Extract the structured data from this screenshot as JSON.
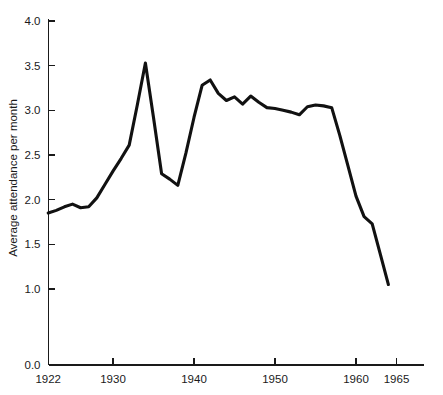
{
  "chart_data": {
    "type": "line",
    "title": "",
    "xlabel": "",
    "ylabel": "Average attendance per month",
    "xlim": [
      1921,
      1966
    ],
    "ylim": [
      0.0,
      4.0
    ],
    "grid": false,
    "legend": "none",
    "axis_break": true,
    "xticks": [
      1922,
      1930,
      1940,
      1950,
      1960,
      1965
    ],
    "xtick_labels": [
      "1922",
      "1930",
      "1940",
      "1950",
      "1960",
      "1965"
    ],
    "yticks": [
      1.0,
      1.5,
      2.0,
      2.5,
      3.0,
      3.5,
      4.0
    ],
    "ytick_labels": [
      "1.0",
      "1.5",
      "2.0",
      "2.5",
      "3.0",
      "3.5",
      "4.0"
    ],
    "y_origin_label": "0.0",
    "series": [
      {
        "name": "Average attendance per month",
        "color": "#111111",
        "x": [
          1922,
          1923,
          1924,
          1925,
          1926,
          1927,
          1928,
          1929,
          1930,
          1931,
          1932,
          1933,
          1934,
          1935,
          1936,
          1937,
          1938,
          1939,
          1940,
          1941,
          1942,
          1943,
          1944,
          1945,
          1946,
          1947,
          1948,
          1949,
          1950,
          1951,
          1952,
          1953,
          1954,
          1955,
          1956,
          1957,
          1958,
          1959,
          1960,
          1961,
          1962,
          1963,
          1964
        ],
        "values": [
          1.85,
          1.88,
          1.92,
          1.95,
          1.91,
          1.92,
          2.02,
          2.17,
          2.32,
          2.46,
          2.61,
          3.06,
          3.53,
          2.92,
          2.29,
          2.23,
          2.16,
          2.52,
          2.92,
          3.28,
          3.34,
          3.19,
          3.11,
          3.15,
          3.07,
          3.16,
          3.09,
          3.03,
          3.02,
          3.0,
          2.98,
          2.95,
          3.04,
          3.06,
          3.05,
          3.03,
          2.72,
          2.38,
          2.04,
          1.81,
          1.73,
          1.39,
          1.05
        ]
      }
    ]
  },
  "figure": {
    "background_color": "#ffffff",
    "line_color": "#111111",
    "axis_color": "#1a1a1a"
  }
}
